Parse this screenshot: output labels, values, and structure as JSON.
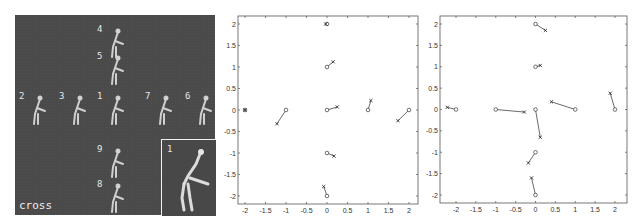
{
  "left_panel": {
    "caption": "cross",
    "inset_label": "1",
    "pose_labels": [
      {
        "id": "4",
        "x": 97,
        "y": 25
      },
      {
        "id": "5",
        "x": 97,
        "y": 52
      },
      {
        "id": "2",
        "x": 19,
        "y": 92
      },
      {
        "id": "3",
        "x": 59,
        "y": 92
      },
      {
        "id": "1",
        "x": 97,
        "y": 92
      },
      {
        "id": "7",
        "x": 145,
        "y": 92
      },
      {
        "id": "6",
        "x": 185,
        "y": 92
      },
      {
        "id": "9",
        "x": 97,
        "y": 145
      },
      {
        "id": "8",
        "x": 97,
        "y": 180
      }
    ]
  },
  "chart_data": [
    {
      "type": "scatter",
      "title": "",
      "xlabel": "",
      "ylabel": "",
      "xlim": [
        -2.2,
        2.2
      ],
      "ylim": [
        -2.2,
        2.2
      ],
      "xticks": [
        "-2",
        "-1.5",
        "-1",
        "-0.5",
        "0",
        "0.5",
        "1",
        "1.5",
        "2"
      ],
      "yticks": [
        "2",
        "1.5",
        "1",
        "0.5",
        "0",
        "-0.5",
        "-1",
        "-1.5",
        "-2"
      ],
      "grid": false,
      "legend": null,
      "description": "Circles mark target pose positions; x marks estimated positions; line segments connect each pair.",
      "pairs": [
        {
          "o": [
            0,
            2
          ],
          "x": [
            -0.03,
            2.0
          ]
        },
        {
          "o": [
            0,
            1
          ],
          "x": [
            0.15,
            1.12
          ]
        },
        {
          "o": [
            -2,
            0
          ],
          "x": [
            -2.0,
            0.0
          ]
        },
        {
          "o": [
            -1,
            0
          ],
          "x": [
            -1.22,
            -0.32
          ]
        },
        {
          "o": [
            0,
            0
          ],
          "x": [
            0.25,
            0.07
          ]
        },
        {
          "o": [
            1,
            0
          ],
          "x": [
            1.07,
            0.22
          ]
        },
        {
          "o": [
            2,
            0
          ],
          "x": [
            1.73,
            -0.25
          ]
        },
        {
          "o": [
            0,
            -1
          ],
          "x": [
            0.17,
            -1.07
          ]
        },
        {
          "o": [
            0,
            -2
          ],
          "x": [
            -0.08,
            -1.78
          ]
        }
      ]
    },
    {
      "type": "scatter",
      "title": "",
      "xlabel": "",
      "ylabel": "",
      "xlim": [
        -2.3,
        2.3
      ],
      "ylim": [
        -2.2,
        2.2
      ],
      "xticks": [
        "-2",
        "-1.5",
        "-1",
        "-0.5",
        "0",
        "0.5",
        "1",
        "1.5",
        "2"
      ],
      "yticks": [
        "2",
        "1.5",
        "1",
        "0.5",
        "0",
        "-0.5",
        "-1",
        "-1.5",
        "-2"
      ],
      "grid": false,
      "legend": null,
      "description": "Circles mark target pose positions; x marks estimated positions; line segments connect each pair.",
      "pairs": [
        {
          "o": [
            0,
            2
          ],
          "x": [
            0.25,
            1.85
          ]
        },
        {
          "o": [
            0,
            1
          ],
          "x": [
            0.12,
            1.03
          ]
        },
        {
          "o": [
            -2,
            0
          ],
          "x": [
            -2.22,
            0.05
          ]
        },
        {
          "o": [
            -1,
            0
          ],
          "x": [
            -0.28,
            -0.06
          ]
        },
        {
          "o": [
            0,
            0
          ],
          "x": [
            0.12,
            -0.65
          ]
        },
        {
          "o": [
            1,
            0
          ],
          "x": [
            0.4,
            0.18
          ]
        },
        {
          "o": [
            2,
            0
          ],
          "x": [
            1.88,
            0.38
          ]
        },
        {
          "o": [
            0,
            -1
          ],
          "x": [
            -0.18,
            -1.25
          ]
        },
        {
          "o": [
            0,
            -2
          ],
          "x": [
            -0.1,
            -1.6
          ]
        }
      ]
    }
  ]
}
